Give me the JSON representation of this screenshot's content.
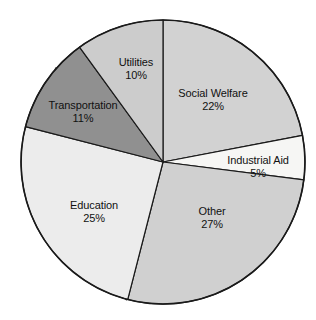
{
  "chart_data": {
    "type": "pie",
    "title": "",
    "subtitle": "",
    "xlabel": "",
    "ylabel": "",
    "legend_position": "none",
    "grid": false,
    "units": "percent",
    "total": 100,
    "start_angle_deg": 0,
    "direction": "clockwise",
    "categories": [
      "Social Welfare",
      "Industrial Aid",
      "Other",
      "Education",
      "Transportation",
      "Utilities"
    ],
    "values": [
      22,
      5,
      27,
      25,
      11,
      10
    ],
    "slices": [
      {
        "name": "Social Welfare",
        "value": 22,
        "value_label": "22%",
        "color": "#d2d2d2",
        "start_deg": 0,
        "end_deg": 79.2,
        "label_x": 213,
        "label_y": 100
      },
      {
        "name": "Industrial Aid",
        "value": 5,
        "value_label": "5%",
        "color": "#f6f6f4",
        "start_deg": 79.2,
        "end_deg": 97.2,
        "label_x": 258,
        "label_y": 167
      },
      {
        "name": "Other",
        "value": 27,
        "value_label": "27%",
        "color": "#d0d0d0",
        "start_deg": 97.2,
        "end_deg": 194.4,
        "label_x": 212,
        "label_y": 218
      },
      {
        "name": "Education",
        "value": 25,
        "value_label": "25%",
        "color": "#ececec",
        "start_deg": 194.4,
        "end_deg": 284.4,
        "label_x": 94,
        "label_y": 212
      },
      {
        "name": "Transportation",
        "value": 11,
        "value_label": "11%",
        "color": "#909090",
        "start_deg": 284.4,
        "end_deg": 324.0,
        "label_x": 83,
        "label_y": 112
      },
      {
        "name": "Utilities",
        "value": 10,
        "value_label": "10%",
        "color": "#cccccc",
        "start_deg": 324.0,
        "end_deg": 360.0,
        "label_x": 136,
        "label_y": 69
      }
    ],
    "geometry": {
      "center_x": 163,
      "center_y": 162,
      "radius": 142
    },
    "style": {
      "outline_color": "#1a1a1a",
      "rim_shadow_color": "#4a4a4a",
      "background": "#ffffff",
      "label_text_color": "#111111"
    }
  }
}
